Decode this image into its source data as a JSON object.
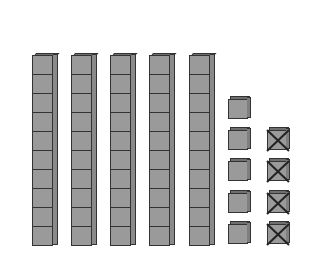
{
  "colors": {
    "cube_face": "#9a9a9a",
    "cube_top": "#6f6f6f",
    "outline": "#333333",
    "background": "#ffffff"
  },
  "model": {
    "tens_rods": 5,
    "cubes_per_rod": 10,
    "ones_cubes": 5,
    "crossed_out_cubes": 4,
    "represents": "54 - 4"
  },
  "rods": [
    {
      "x": 32,
      "y": 56
    },
    {
      "x": 71,
      "y": 56
    },
    {
      "x": 110,
      "y": 56
    },
    {
      "x": 149,
      "y": 56
    },
    {
      "x": 189,
      "y": 56
    }
  ],
  "ones": [
    {
      "x": 228,
      "y": 96,
      "crossed": false
    },
    {
      "x": 228,
      "y": 127,
      "crossed": false
    },
    {
      "x": 228,
      "y": 158,
      "crossed": false
    },
    {
      "x": 228,
      "y": 190,
      "crossed": false
    },
    {
      "x": 228,
      "y": 221,
      "crossed": false
    },
    {
      "x": 267,
      "y": 127,
      "crossed": true
    },
    {
      "x": 267,
      "y": 158,
      "crossed": true
    },
    {
      "x": 267,
      "y": 190,
      "crossed": true
    },
    {
      "x": 267,
      "y": 221,
      "crossed": true
    }
  ]
}
